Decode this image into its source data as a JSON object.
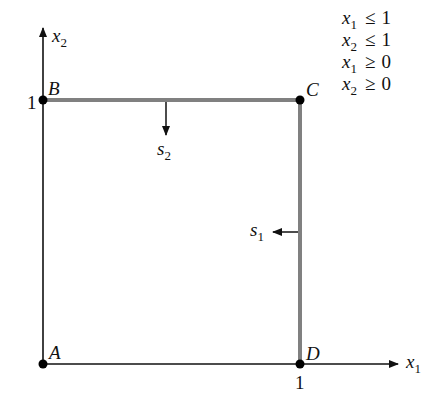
{
  "figure": {
    "axes": {
      "x_axis": {
        "var": "x",
        "sub": "1",
        "tick_label": "1"
      },
      "y_axis": {
        "var": "x",
        "sub": "2",
        "tick_label": "1"
      }
    },
    "vertices": [
      {
        "name": "A",
        "coords": [
          0,
          0
        ]
      },
      {
        "name": "B",
        "coords": [
          0,
          1
        ]
      },
      {
        "name": "C",
        "coords": [
          1,
          1
        ]
      },
      {
        "name": "D",
        "coords": [
          1,
          0
        ]
      }
    ],
    "slack_labels": [
      {
        "var": "s",
        "sub": "2",
        "direction": "down"
      },
      {
        "var": "s",
        "sub": "1",
        "direction": "left"
      }
    ],
    "constraints": [
      {
        "var": "x",
        "sub": "1",
        "op": "≤",
        "rhs": "1"
      },
      {
        "var": "x",
        "sub": "2",
        "op": "≤",
        "rhs": "1"
      },
      {
        "var": "x",
        "sub": "1",
        "op": "≥",
        "rhs": "0"
      },
      {
        "var": "x",
        "sub": "2",
        "op": "≥",
        "rhs": "0"
      }
    ],
    "colors": {
      "axis": "#111111",
      "constraint_edge": "#808080",
      "vertex": "#000000"
    }
  }
}
